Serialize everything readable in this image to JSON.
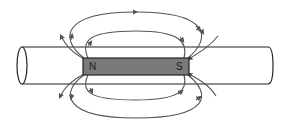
{
  "diagram": {
    "title": "",
    "magnet": {
      "north_label": "N",
      "south_label": "S",
      "fill_color": "#7a7a7a",
      "border_color": "#222222"
    },
    "rod": {
      "stroke_color": "#222222",
      "fill_color": "#ffffff"
    },
    "field_lines": {
      "color": "#555555",
      "count_top": 4,
      "count_bottom": 4,
      "direction": "N to S (exiting N, entering S)"
    }
  }
}
